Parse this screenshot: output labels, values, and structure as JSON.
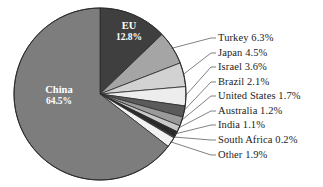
{
  "chart_data": {
    "type": "pie",
    "title": "",
    "subtitle": "",
    "xlabel": "",
    "ylabel": "",
    "legend_position": "callout-right",
    "grid": false,
    "units": "percent",
    "start_angle_deg": 0,
    "direction": "clockwise",
    "categories": [
      "EU",
      "Turkey",
      "Japan",
      "Israel",
      "Brazil",
      "United States",
      "Australia",
      "India",
      "South Africa",
      "Other",
      "China"
    ],
    "values": [
      12.8,
      6.3,
      4.5,
      3.6,
      2.1,
      1.7,
      1.2,
      1.1,
      0.2,
      1.9,
      64.5
    ],
    "slices": [
      {
        "name": "EU",
        "value": 12.8,
        "label": "EU 12.8%",
        "color": "#3f3f3f",
        "label_placement": "inside"
      },
      {
        "name": "Turkey",
        "value": 6.3,
        "label": "Turkey 6.3%",
        "color": "#a5a5a5",
        "label_placement": "callout"
      },
      {
        "name": "Japan",
        "value": 4.5,
        "label": "Japan 4.5%",
        "color": "#d2d2d2",
        "label_placement": "callout"
      },
      {
        "name": "Israel",
        "value": 3.6,
        "label": "Israel 3.6%",
        "color": "#ededed",
        "label_placement": "callout"
      },
      {
        "name": "Brazil",
        "value": 2.1,
        "label": "Brazil 2.1%",
        "color": "#5b5b5b",
        "label_placement": "callout"
      },
      {
        "name": "United States",
        "value": 1.7,
        "label": "United States 1.7%",
        "color": "#9a9a9a",
        "label_placement": "callout"
      },
      {
        "name": "Australia",
        "value": 1.2,
        "label": "Australia 1.2%",
        "color": "#c9c9c9",
        "label_placement": "callout"
      },
      {
        "name": "India",
        "value": 1.1,
        "label": "India 1.1%",
        "color": "#2a2a2a",
        "label_placement": "callout"
      },
      {
        "name": "South Africa",
        "value": 0.2,
        "label": "South Africa 0.2%",
        "color": "#7b7b7b",
        "label_placement": "callout"
      },
      {
        "name": "Other",
        "value": 1.9,
        "label": "Other 1.9%",
        "color": "#f2f2f2",
        "label_placement": "callout"
      },
      {
        "name": "China",
        "value": 64.5,
        "label": "China 64.5%",
        "color": "#7d7d7d",
        "label_placement": "inside"
      }
    ],
    "callouts": [
      {
        "label": "Turkey 6.3%",
        "x": 218,
        "y": 33
      },
      {
        "label": "Japan 4.5%",
        "x": 218,
        "y": 48
      },
      {
        "label": "Israel 3.6%",
        "x": 218,
        "y": 62
      },
      {
        "label": "Brazil 2.1%",
        "x": 218,
        "y": 77
      },
      {
        "label": "United States 1.7%",
        "x": 218,
        "y": 91
      },
      {
        "label": "Australia 1.2%",
        "x": 218,
        "y": 106
      },
      {
        "label": "India 1.1%",
        "x": 218,
        "y": 120
      },
      {
        "label": "South Africa 0.2%",
        "x": 218,
        "y": 135
      },
      {
        "label": "Other 1.9%",
        "x": 218,
        "y": 150
      }
    ],
    "inside_labels": [
      {
        "name": "China",
        "name_text": "China",
        "pct_text": "64.5%"
      },
      {
        "name": "EU",
        "name_text": "EU",
        "pct_text": "12.8%"
      }
    ],
    "geometry": {
      "center_x": 100,
      "center_y": 94,
      "radius": 86,
      "outline_color": "#2b2b2b",
      "leader_color": "#4a4a4a",
      "background": "#ffffff"
    }
  }
}
